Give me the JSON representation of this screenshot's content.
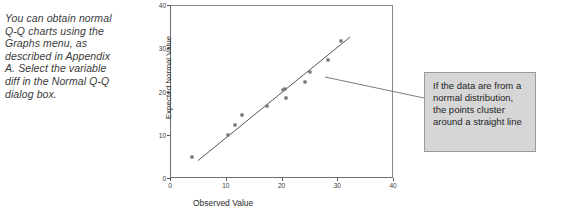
{
  "side_note": {
    "text": "You can obtain normal Q-Q charts using the Graphs menu, as described in Appendix A. Select the variable diff in the Normal Q-Q dialog box."
  },
  "callout": {
    "text": "If the data are from a normal distribution, the points cluster around a straight line"
  },
  "chart_data": {
    "type": "scatter",
    "title": "",
    "xlabel": "Observed Value",
    "ylabel": "Expected Normal Value",
    "xlim": [
      0,
      40
    ],
    "ylim": [
      0,
      40
    ],
    "xticks": [
      0,
      10,
      20,
      30,
      40
    ],
    "yticks": [
      0,
      10,
      20,
      30,
      40
    ],
    "grid": false,
    "legend": null,
    "points": [
      {
        "x": 3.9,
        "y": 4.9
      },
      {
        "x": 10.4,
        "y": 9.9
      },
      {
        "x": 11.6,
        "y": 12.3
      },
      {
        "x": 13.0,
        "y": 14.6
      },
      {
        "x": 17.4,
        "y": 16.7
      },
      {
        "x": 20.3,
        "y": 20.4
      },
      {
        "x": 20.6,
        "y": 20.6
      },
      {
        "x": 20.8,
        "y": 18.6
      },
      {
        "x": 24.3,
        "y": 22.3
      },
      {
        "x": 25.2,
        "y": 24.6
      },
      {
        "x": 28.4,
        "y": 27.3
      },
      {
        "x": 30.6,
        "y": 31.7
      }
    ],
    "fit_line": {
      "x0": 5.0,
      "y0": 4.0,
      "x1": 32.3,
      "y1": 32.6
    }
  },
  "colors": {
    "axis": "#6e6e6e",
    "marker_edge": "#4a4a4a",
    "fit_line": "#585858",
    "callout_bg": "#d6d6d6",
    "callout_border": "#9a9a9a"
  }
}
